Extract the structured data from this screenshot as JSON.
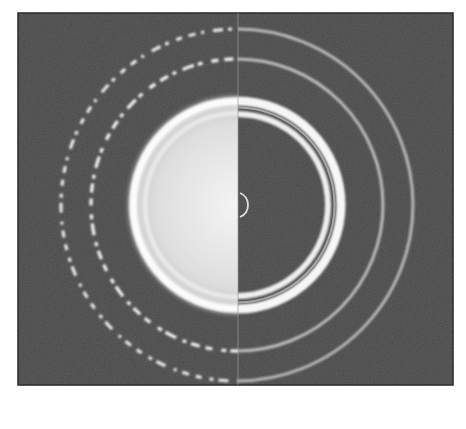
{
  "figure": {
    "description": "Split-view electron diffraction ring pattern: left half shows spotty (single-crystal-like) rings, right half shows continuous rings",
    "colors": {
      "page_background": "#ffffff",
      "panel_background": "#4a4a4a",
      "panel_border": "#222222",
      "bright_disc": "#e6e6e6",
      "ring_bright": "#f2f2f2",
      "ring_dim": "#b8b8b8",
      "divider": "#9a9a9a"
    },
    "panel": {
      "x": 18,
      "y": 13,
      "width": 435,
      "height": 372
    },
    "center": {
      "x": 237,
      "y": 205
    },
    "divider_x": 238,
    "rings": [
      {
        "name": "outer-ring",
        "radius": 176,
        "left_style": "spotty",
        "right_style": "continuous"
      },
      {
        "name": "second-ring",
        "radius": 146,
        "left_style": "spotty",
        "right_style": "continuous"
      },
      {
        "name": "disc-outer-ring",
        "radius": 105,
        "left_style": "filled",
        "right_style": "continuous"
      },
      {
        "name": "disc-inner-ring",
        "radius": 92,
        "left_style": "filled",
        "right_style": "continuous"
      }
    ],
    "center_arc": {
      "cx": 243,
      "cy": 205,
      "r": 13
    }
  }
}
